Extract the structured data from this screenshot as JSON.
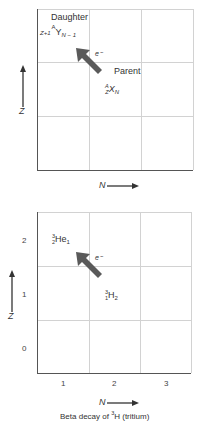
{
  "top_diagram": {
    "daughter_label": "Daughter",
    "daughter_symbol": {
      "element": "Y",
      "mass": "A",
      "atomic": "Z+1",
      "neutron": "N − 1"
    },
    "parent_label": "Parent",
    "parent_symbol": {
      "element": "X",
      "mass": "A",
      "atomic": "Z",
      "neutron": "N"
    },
    "emission_label": "e⁻",
    "y_axis_label": "Z",
    "x_axis_label": "N"
  },
  "bottom_diagram": {
    "daughter_symbol": {
      "element": "He",
      "mass": "3",
      "atomic": "2",
      "neutron": "1"
    },
    "parent_symbol": {
      "element": "H",
      "mass": "3",
      "atomic": "1",
      "neutron": "2"
    },
    "emission_label": "e⁻",
    "y_axis_label": "Z",
    "x_axis_label": "N",
    "y_ticks": [
      "2",
      "1",
      "0"
    ],
    "x_ticks": [
      "1",
      "2",
      "3"
    ],
    "caption_prefix": "Beta decay of ",
    "caption_mass": "3",
    "caption_suffix": "H (tritium)"
  },
  "colors": {
    "arrow": "#5a5a5a",
    "grid": "#d2d2d2",
    "axis": "#555555"
  }
}
